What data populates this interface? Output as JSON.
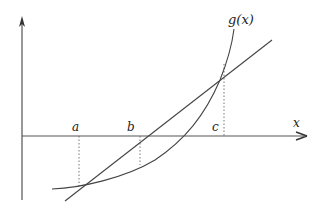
{
  "diagram": {
    "curve_label": "g(x)",
    "x_axis_label": "x",
    "points": [
      {
        "label": "a"
      },
      {
        "label": "b"
      },
      {
        "label": "c"
      }
    ]
  }
}
